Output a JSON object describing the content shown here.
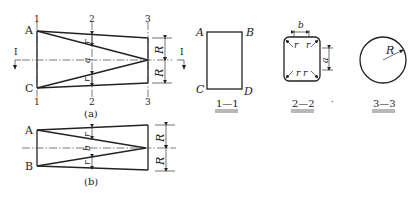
{
  "figure_a": {
    "caption": "(a)",
    "points": {
      "top_left": "A",
      "bottom_left": "C"
    },
    "section_marks": {
      "s1": "1",
      "s2": "2",
      "s3": "3"
    },
    "cut_mark": "I",
    "dims": {
      "r": "r",
      "a": "a",
      "R": "R"
    }
  },
  "figure_b": {
    "caption": "(b)",
    "points": {
      "top_left": "A",
      "bottom_left": "B"
    },
    "dims": {
      "r": "r",
      "b": "b",
      "R": "R"
    }
  },
  "section_1_1": {
    "title": "1—1",
    "corners": {
      "tl": "A",
      "tr": "B",
      "bl": "C",
      "br": "D"
    }
  },
  "section_2_2": {
    "title": "2—2",
    "dims": {
      "b": "b",
      "a": "a",
      "r": "r"
    }
  },
  "separator_dot": "·",
  "section_3_3": {
    "title": "3—3",
    "dims": {
      "R": "R"
    }
  }
}
